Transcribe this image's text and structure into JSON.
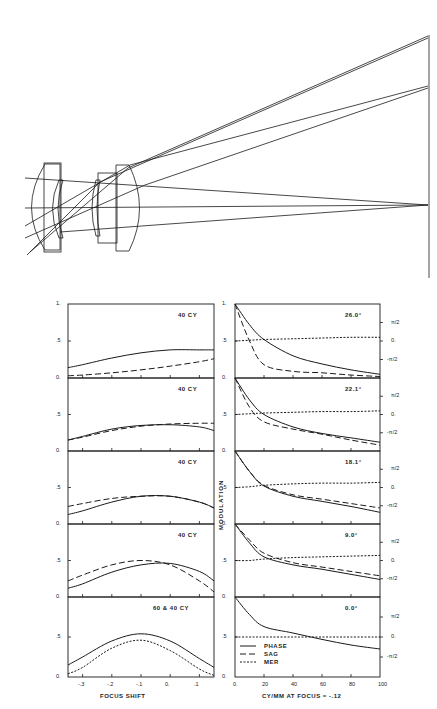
{
  "lens_diagram": {
    "description": "Optical lens cross-section with ray trace to image plane",
    "elements": 4,
    "image_plane_points": 3
  },
  "left_column": {
    "xlabel": "FOCUS SHIFT",
    "x_ticks": [
      "-.3",
      "-.2",
      "-.1",
      "0.",
      ".1"
    ],
    "y_ticks": [
      "0.",
      ".5",
      "1."
    ],
    "panels": [
      {
        "label": "40  CY"
      },
      {
        "label": "40  CY"
      },
      {
        "label": "40  CY"
      },
      {
        "label": "40  CY"
      },
      {
        "label": "60 & 40  CY"
      }
    ]
  },
  "right_column": {
    "xlabel": "CY/MM AT FOCUS = -.12",
    "ylabel": "MODULATION",
    "x_ticks": [
      "0.",
      "20",
      "40",
      "60",
      "80",
      "100"
    ],
    "y_ticks": [
      "0.",
      ".5",
      "1."
    ],
    "phase_ticks": [
      "π/2",
      "0.",
      "-π/2"
    ],
    "panels": [
      {
        "label": "26.0°"
      },
      {
        "label": "22.1°"
      },
      {
        "label": "18.1°"
      },
      {
        "label": "9.0°"
      },
      {
        "label": "0.0°"
      }
    ],
    "legend": [
      {
        "label": "PHASE",
        "style": "solid"
      },
      {
        "label": "SAG",
        "style": "long-dash"
      },
      {
        "label": "MER",
        "style": "short-dash"
      }
    ]
  },
  "chart_data": [
    {
      "type": "line",
      "title": "Through-focus MTF, 26.0°",
      "xlabel": "FOCUS SHIFT",
      "ylabel": "MODULATION",
      "x": [
        -0.35,
        -0.3,
        -0.2,
        -0.1,
        0.0,
        0.1,
        0.15
      ],
      "series": [
        {
          "name": "solid (40 CY)",
          "values": [
            0.14,
            0.18,
            0.27,
            0.34,
            0.38,
            0.38,
            0.38
          ]
        },
        {
          "name": "dashed (40 CY)",
          "values": [
            0.03,
            0.04,
            0.07,
            0.11,
            0.16,
            0.22,
            0.26
          ]
        }
      ],
      "ylim": [
        0,
        1
      ],
      "annotation": "40 CY"
    },
    {
      "type": "line",
      "title": "Through-focus MTF, 22.1°",
      "x": [
        -0.35,
        -0.3,
        -0.2,
        -0.1,
        0.0,
        0.1,
        0.15
      ],
      "series": [
        {
          "name": "solid",
          "values": [
            0.15,
            0.2,
            0.3,
            0.35,
            0.36,
            0.33,
            0.28
          ]
        },
        {
          "name": "dashed",
          "values": [
            0.15,
            0.19,
            0.28,
            0.34,
            0.37,
            0.38,
            0.38
          ]
        }
      ],
      "ylim": [
        0,
        1
      ],
      "annotation": "40 CY"
    },
    {
      "type": "line",
      "title": "Through-focus MTF, 18.1°",
      "x": [
        -0.35,
        -0.3,
        -0.2,
        -0.1,
        0.0,
        0.1,
        0.15
      ],
      "series": [
        {
          "name": "solid",
          "values": [
            0.13,
            0.18,
            0.3,
            0.38,
            0.38,
            0.3,
            0.22
          ]
        },
        {
          "name": "dashed",
          "values": [
            0.24,
            0.28,
            0.35,
            0.38,
            0.38,
            0.3,
            0.22
          ]
        }
      ],
      "ylim": [
        0,
        1
      ],
      "annotation": "40 CY"
    },
    {
      "type": "line",
      "title": "Through-focus MTF, 9.0°",
      "x": [
        -0.35,
        -0.3,
        -0.2,
        -0.1,
        0.0,
        0.1,
        0.15
      ],
      "series": [
        {
          "name": "solid",
          "values": [
            0.12,
            0.18,
            0.34,
            0.44,
            0.46,
            0.35,
            0.22
          ]
        },
        {
          "name": "dashed",
          "values": [
            0.22,
            0.3,
            0.44,
            0.5,
            0.44,
            0.22,
            0.07
          ]
        }
      ],
      "ylim": [
        0,
        1
      ],
      "annotation": "40 CY"
    },
    {
      "type": "line",
      "title": "Through-focus MTF, 0.0°",
      "x": [
        -0.35,
        -0.3,
        -0.2,
        -0.1,
        0.0,
        0.1,
        0.15
      ],
      "series": [
        {
          "name": "solid (40 CY)",
          "values": [
            0.15,
            0.25,
            0.45,
            0.54,
            0.45,
            0.23,
            0.12
          ]
        },
        {
          "name": "short-dash (60 CY)",
          "values": [
            0.04,
            0.12,
            0.36,
            0.46,
            0.33,
            0.1,
            0.02
          ]
        }
      ],
      "ylim": [
        0,
        1
      ],
      "annotation": "60 & 40 CY"
    },
    {
      "type": "line",
      "title": "MTF vs spatial frequency, 26.0°",
      "xlabel": "CY/MM AT FOCUS = -.12",
      "ylabel": "MODULATION",
      "x": [
        0,
        10,
        20,
        40,
        60,
        80,
        100
      ],
      "series": [
        {
          "name": "PHASE",
          "values": [
            1.0,
            0.72,
            0.52,
            0.3,
            0.19,
            0.11,
            0.05
          ]
        },
        {
          "name": "SAG",
          "values": [
            1.0,
            0.5,
            0.18,
            0.09,
            0.07,
            0.04,
            0.02
          ]
        },
        {
          "name": "MER",
          "values": [
            0.5,
            0.51,
            0.52,
            0.53,
            0.54,
            0.55,
            0.55
          ]
        }
      ],
      "ylim": [
        0,
        1
      ],
      "annotation": "26.0°"
    },
    {
      "type": "line",
      "title": "MTF vs spatial frequency, 22.1°",
      "x": [
        0,
        10,
        20,
        40,
        60,
        80,
        100
      ],
      "series": [
        {
          "name": "PHASE",
          "values": [
            1.0,
            0.7,
            0.5,
            0.33,
            0.24,
            0.18,
            0.12
          ]
        },
        {
          "name": "SAG",
          "values": [
            1.0,
            0.6,
            0.4,
            0.3,
            0.23,
            0.15,
            0.08
          ]
        },
        {
          "name": "MER",
          "values": [
            0.5,
            0.51,
            0.52,
            0.53,
            0.54,
            0.54,
            0.55
          ]
        }
      ],
      "ylim": [
        0,
        1
      ],
      "annotation": "22.1°"
    },
    {
      "type": "line",
      "title": "MTF vs spatial frequency, 18.1°",
      "x": [
        0,
        10,
        20,
        40,
        60,
        80,
        100
      ],
      "series": [
        {
          "name": "PHASE",
          "values": [
            1.0,
            0.72,
            0.52,
            0.38,
            0.31,
            0.24,
            0.16
          ]
        },
        {
          "name": "SAG",
          "values": [
            1.0,
            0.72,
            0.53,
            0.4,
            0.34,
            0.28,
            0.22
          ]
        },
        {
          "name": "MER",
          "values": [
            0.5,
            0.51,
            0.53,
            0.55,
            0.56,
            0.56,
            0.57
          ]
        }
      ],
      "ylim": [
        0,
        1
      ],
      "annotation": "18.1°"
    },
    {
      "type": "line",
      "title": "MTF vs spatial frequency, 9.0°",
      "x": [
        0,
        10,
        20,
        40,
        60,
        80,
        100
      ],
      "series": [
        {
          "name": "PHASE",
          "values": [
            1.0,
            0.74,
            0.55,
            0.44,
            0.38,
            0.31,
            0.24
          ]
        },
        {
          "name": "SAG",
          "values": [
            1.0,
            0.78,
            0.6,
            0.47,
            0.41,
            0.35,
            0.29
          ]
        },
        {
          "name": "MER",
          "values": [
            0.5,
            0.5,
            0.52,
            0.54,
            0.55,
            0.56,
            0.57
          ]
        }
      ],
      "ylim": [
        0,
        1
      ],
      "annotation": "9.0°"
    },
    {
      "type": "line",
      "title": "MTF vs spatial frequency, 0.0°",
      "x": [
        0,
        10,
        20,
        40,
        60,
        80,
        100
      ],
      "series": [
        {
          "name": "PHASE",
          "values": [
            1.0,
            0.78,
            0.63,
            0.55,
            0.47,
            0.4,
            0.35
          ]
        },
        {
          "name": "MER",
          "values": [
            0.5,
            0.5,
            0.5,
            0.5,
            0.5,
            0.5,
            0.5
          ]
        }
      ],
      "ylim": [
        0,
        1
      ],
      "annotation": "0.0°"
    }
  ]
}
